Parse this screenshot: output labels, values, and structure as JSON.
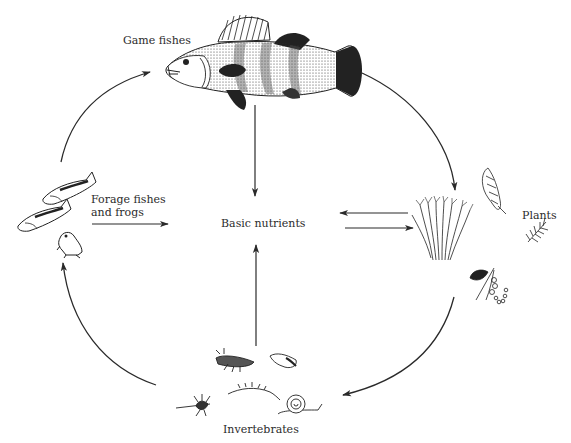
{
  "diagram": {
    "type": "food-web-cycle",
    "nodes": {
      "game_fishes": {
        "label": "Game fishes",
        "icon": "perch-fish-icon"
      },
      "forage": {
        "label_line1": "Forage fishes",
        "label_line2": "and frogs",
        "icon": "forage-fish-frog-icon"
      },
      "nutrients": {
        "label": "Basic nutrients"
      },
      "plants": {
        "label": "Plants",
        "icon": "aquatic-plants-icon"
      },
      "invertebrates": {
        "label": "Invertebrates",
        "icon": "invertebrates-icon"
      }
    },
    "edges": [
      {
        "from": "Forage fishes and frogs",
        "to": "Game fishes",
        "style": "curved-arrow"
      },
      {
        "from": "Game fishes",
        "to": "Plants",
        "style": "curved-arrow"
      },
      {
        "from": "Plants",
        "to": "Invertebrates",
        "style": "curved-arrow"
      },
      {
        "from": "Invertebrates",
        "to": "Forage fishes and frogs",
        "style": "curved-arrow"
      },
      {
        "from": "Game fishes",
        "to": "Basic nutrients",
        "style": "straight-arrow"
      },
      {
        "from": "Invertebrates",
        "to": "Basic nutrients",
        "style": "straight-arrow"
      },
      {
        "from": "Forage fishes and frogs",
        "to": "Basic nutrients",
        "style": "straight-arrow"
      },
      {
        "from": "Plants",
        "to": "Basic nutrients",
        "style": "straight-arrow"
      },
      {
        "from": "Basic nutrients",
        "to": "Plants",
        "style": "straight-arrow"
      }
    ],
    "colors": {
      "ink": "#2a2a2a",
      "background": "#ffffff"
    }
  }
}
